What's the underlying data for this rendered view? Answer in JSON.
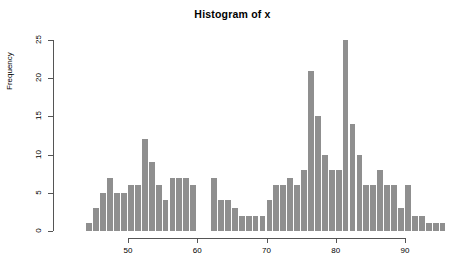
{
  "chart": {
    "title": "Histogram of x",
    "ylabel": "Frequency",
    "xlabel": ""
  },
  "chart_data": {
    "type": "bar",
    "title": "Histogram of x",
    "xlabel": "",
    "ylabel": "Frequency",
    "grid": false,
    "legend": false,
    "xlim": [
      43,
      96
    ],
    "ylim": [
      0,
      25
    ],
    "xticks": [
      50,
      60,
      70,
      80,
      90
    ],
    "yticks": [
      0,
      5,
      10,
      15,
      20,
      25
    ],
    "bin_width": 1,
    "bin_starts": [
      44,
      45,
      46,
      47,
      48,
      49,
      50,
      51,
      52,
      53,
      54,
      55,
      56,
      57,
      58,
      59,
      62,
      63,
      64,
      65,
      66,
      67,
      68,
      69,
      70,
      71,
      72,
      73,
      74,
      75,
      76,
      77,
      78,
      79,
      80,
      81,
      82,
      83,
      84,
      85,
      86,
      87,
      88,
      89,
      90,
      91,
      92,
      93,
      94,
      95
    ],
    "categories": [
      "44",
      "45",
      "46",
      "47",
      "48",
      "49",
      "50",
      "51",
      "52",
      "53",
      "54",
      "55",
      "56",
      "57",
      "58",
      "59",
      "62",
      "63",
      "64",
      "65",
      "66",
      "67",
      "68",
      "69",
      "70",
      "71",
      "72",
      "73",
      "74",
      "75",
      "76",
      "77",
      "78",
      "79",
      "80",
      "81",
      "82",
      "83",
      "84",
      "85",
      "86",
      "87",
      "88",
      "89",
      "90",
      "91",
      "92",
      "93",
      "94",
      "95"
    ],
    "values": [
      1,
      3,
      5,
      7,
      5,
      5,
      6,
      6,
      12,
      9,
      6,
      4,
      7,
      7,
      7,
      6,
      7,
      4,
      4,
      3,
      2,
      2,
      2,
      2,
      4,
      6,
      6,
      7,
      6,
      8,
      21,
      15,
      10,
      8,
      8,
      25,
      14,
      10,
      6,
      6,
      8,
      6,
      6,
      3,
      6,
      2,
      2,
      1,
      1,
      1
    ]
  }
}
